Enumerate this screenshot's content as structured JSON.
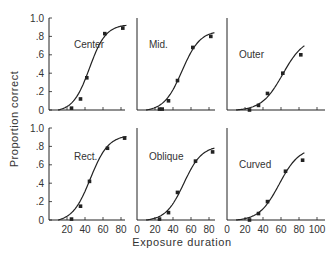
{
  "chart_data": {
    "type": "line",
    "layout": "2x3 small multiples",
    "xlabel": "Exposure duration",
    "ylabel": "Proportion correct",
    "xlim": [
      0,
      100
    ],
    "ylim": [
      0,
      1.0
    ],
    "y_ticks": [
      "0",
      ".2",
      ".4",
      ".6",
      ".8",
      "1.0"
    ],
    "x_ticks_left": [
      "20",
      "40",
      "60",
      "80"
    ],
    "x_ticks_middle": [
      "0",
      "20",
      "40",
      "60",
      "80"
    ],
    "x_ticks_right": [
      "0",
      "20",
      "40",
      "60",
      "80",
      "100"
    ],
    "grid": false,
    "panels": [
      {
        "label": "Center",
        "row": 0,
        "col": 0,
        "x": [
          25,
          35,
          42,
          62,
          82
        ],
        "y": [
          0.02,
          0.12,
          0.35,
          0.83,
          0.89
        ],
        "fit": {
          "mid": 45,
          "slope": 0.11,
          "max": 0.95
        }
      },
      {
        "label": "Mid.",
        "row": 0,
        "col": 1,
        "x": [
          25,
          28,
          35,
          45,
          62,
          82
        ],
        "y": [
          0.01,
          0.01,
          0.1,
          0.32,
          0.68,
          0.8
        ],
        "fit": {
          "mid": 50,
          "slope": 0.1,
          "max": 0.88
        }
      },
      {
        "label": "Outer",
        "row": 0,
        "col": 2,
        "x": [
          25,
          35,
          45,
          62,
          82
        ],
        "y": [
          0.0,
          0.05,
          0.18,
          0.4,
          0.6
        ],
        "fit": {
          "mid": 62,
          "slope": 0.085,
          "max": 0.8
        }
      },
      {
        "label": "Rect.",
        "row": 1,
        "col": 0,
        "x": [
          25,
          35,
          45,
          65,
          84
        ],
        "y": [
          0.01,
          0.15,
          0.42,
          0.78,
          0.89
        ],
        "fit": {
          "mid": 46,
          "slope": 0.1,
          "max": 0.95
        }
      },
      {
        "label": "Oblique",
        "row": 1,
        "col": 1,
        "x": [
          25,
          35,
          45,
          65,
          84
        ],
        "y": [
          0.01,
          0.08,
          0.3,
          0.64,
          0.74
        ],
        "fit": {
          "mid": 52,
          "slope": 0.1,
          "max": 0.82
        }
      },
      {
        "label": "Curved",
        "row": 1,
        "col": 2,
        "x": [
          25,
          35,
          45,
          65,
          84
        ],
        "y": [
          0.0,
          0.07,
          0.2,
          0.53,
          0.65
        ],
        "fit": {
          "mid": 58,
          "slope": 0.09,
          "max": 0.8
        }
      }
    ]
  }
}
